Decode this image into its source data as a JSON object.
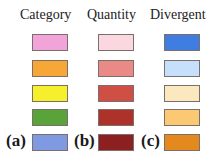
{
  "columns": [
    {
      "title": "Category",
      "label": "(a)",
      "swatches": [
        "#f2a3d8",
        "#f7a736",
        "#f5ef2c",
        "#5aa23a",
        "#7f9ae0"
      ]
    },
    {
      "title": "Quantity",
      "label": "(b)",
      "swatches": [
        "#fbd8e0",
        "#e98a86",
        "#cf4f44",
        "#ad3229",
        "#8c1f20"
      ]
    },
    {
      "title": "Divergent",
      "label": "(c)",
      "swatches": [
        "#3f7ee0",
        "#c6e0fb",
        "#fbe8bf",
        "#fbc873",
        "#e4891e"
      ]
    }
  ]
}
